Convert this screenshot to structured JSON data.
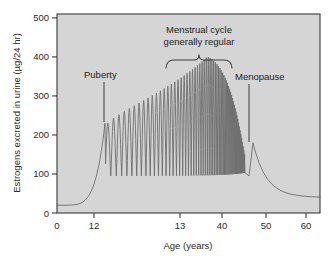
{
  "chart_data": {
    "type": "line",
    "title": "",
    "xlabel": "Age (years)",
    "ylabel": "Estrogens excreted in urine (µg/24 hr)",
    "xlim": [
      0,
      63
    ],
    "ylim": [
      0,
      510
    ],
    "grid": false,
    "legend": null,
    "x_ticks": [
      {
        "label": "0",
        "pos": 0
      },
      {
        "label": "12",
        "pos": 12
      },
      {
        "label": "13",
        "pos": 31
      },
      {
        "label": "40",
        "pos": 40
      },
      {
        "label": "50",
        "pos": 50
      },
      {
        "label": "60",
        "pos": 60
      }
    ],
    "y_ticks": [
      {
        "label": "0",
        "value": 0
      },
      {
        "label": "100",
        "value": 100
      },
      {
        "label": "200",
        "value": 200
      },
      {
        "label": "300",
        "value": 300
      },
      {
        "label": "400",
        "value": 400
      },
      {
        "label": "500",
        "value": 500
      }
    ],
    "annotations": [
      {
        "name": "puberty",
        "text": "Puberty"
      },
      {
        "name": "menstrual-cycle",
        "line1": "Menstrual cycle",
        "line2": "generally  regular"
      },
      {
        "name": "menopause",
        "text": "Menopause"
      }
    ],
    "series": [
      {
        "name": "Estrogen excretion over lifespan",
        "description": "Low flat baseline in childhood (~20), exponential rise at puberty, widening then narrowing oscillatory menstrual cycles peaking near 400, final menopausal spike near 180, then exponential decay to ~40",
        "baseline_value": 20,
        "puberty_onset_age": 12,
        "first_cycle_peak": 230,
        "max_cycle_peak": 400,
        "cycle_trough": 95,
        "menopause_age": 45,
        "menopause_spike": 180,
        "end_value": 40
      }
    ],
    "colors": {
      "plot_background": "#d5d5d5",
      "curve": "#6e6e6e",
      "frame": "#3a3a3a",
      "text": "#2b2b2b",
      "page_background": "#ffffff"
    }
  }
}
